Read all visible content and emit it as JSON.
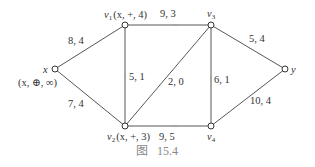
{
  "figure": {
    "caption_prefix": "图",
    "caption_number": "15.4"
  },
  "nodes": {
    "x": {
      "name": "x",
      "label": "(x, ⊕, ∞)"
    },
    "v1": {
      "name": "v",
      "sub": "1",
      "label": "(x, +, 4)"
    },
    "v2": {
      "name": "v",
      "sub": "2",
      "label": "(x, +, 3)"
    },
    "v3": {
      "name": "v",
      "sub": "3"
    },
    "v4": {
      "name": "v",
      "sub": "4"
    },
    "y": {
      "name": "y"
    }
  },
  "edges": {
    "x_v1": {
      "from": "x",
      "to": "v1",
      "label": "8, 4"
    },
    "x_v2": {
      "from": "x",
      "to": "v2",
      "label": "7, 4"
    },
    "v1_v3": {
      "from": "v1",
      "to": "v3",
      "label": "9, 3"
    },
    "v1_v2": {
      "from": "v1",
      "to": "v2",
      "label": "5, 1"
    },
    "v3_v2": {
      "from": "v3",
      "to": "v2",
      "label": "2, 0"
    },
    "v4_v3": {
      "from": "v4",
      "to": "v3",
      "label": "6, 1"
    },
    "v2_v4": {
      "from": "v2",
      "to": "v4",
      "label": "9, 5"
    },
    "v3_y": {
      "from": "v3",
      "to": "y",
      "label": "5, 4"
    },
    "v4_y": {
      "from": "v4",
      "to": "y",
      "label": "10, 4"
    }
  },
  "colors": {
    "line": "#444444",
    "caption": "#888888"
  }
}
